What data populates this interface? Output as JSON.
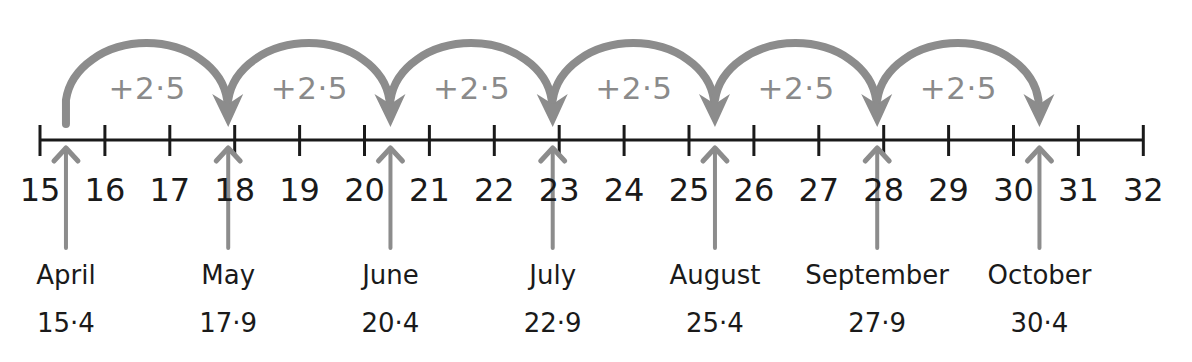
{
  "chart_data": {
    "type": "number_line",
    "axis": {
      "min": 15,
      "max": 32,
      "step": 1,
      "tick_labels": [
        "15",
        "16",
        "17",
        "18",
        "19",
        "20",
        "21",
        "22",
        "23",
        "24",
        "25",
        "26",
        "27",
        "28",
        "29",
        "30",
        "31",
        "32"
      ]
    },
    "jump_label": "+2·5",
    "jump_size": 2.5,
    "points": [
      {
        "month": "April",
        "value": 15.4,
        "label": "15·4"
      },
      {
        "month": "May",
        "value": 17.9,
        "label": "17·9"
      },
      {
        "month": "June",
        "value": 20.4,
        "label": "20·4"
      },
      {
        "month": "July",
        "value": 22.9,
        "label": "22·9"
      },
      {
        "month": "August",
        "value": 25.4,
        "label": "25·4"
      },
      {
        "month": "September",
        "value": 27.9,
        "label": "27·9"
      },
      {
        "month": "October",
        "value": 30.4,
        "label": "30·4"
      }
    ],
    "jumps": [
      "+2·5",
      "+2·5",
      "+2·5",
      "+2·5",
      "+2·5",
      "+2·5"
    ]
  },
  "colors": {
    "axis": "#1a1a1a",
    "arrow": "#8c8c8c",
    "jump_text": "#8a8a8a",
    "text": "#1a1a1a"
  }
}
